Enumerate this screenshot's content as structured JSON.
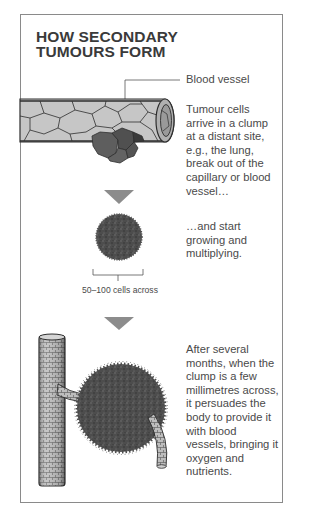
{
  "title": "HOW SECONDARY\nTUMOURS FORM",
  "labels": {
    "blood_vessel": "Blood vessel",
    "cells_across": "50–100 cells across"
  },
  "steps": [
    {
      "text": "Tumour cells\narrive in a clump\nat a distant site,\ne.g., the lung,\nbreak out of the\ncapillary or blood\nvessel…"
    },
    {
      "text": "…and start\ngrowing and\nmultiplying."
    },
    {
      "text": "After several\nmonths, when the\nclump is a few\nmillimetres across,\nit persuades the\nbody to provide it\nwith blood\nvessels, bringing it\noxygen and\nnutrients."
    }
  ],
  "colors": {
    "border": "#8a8a8a",
    "vessel_fill": "#c4c4c4",
    "vessel_line": "#2e2e2e",
    "tumour": "#4f4f4f",
    "arrow": "#8c8c8c",
    "text": "#4a4a4a"
  }
}
